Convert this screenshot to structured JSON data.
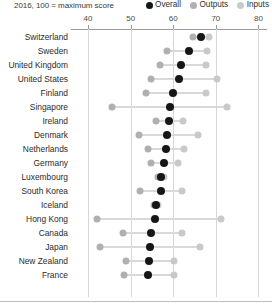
{
  "header": {
    "subtitle": "2016, 100 = maximum score"
  },
  "legend": {
    "position": "top-right",
    "entries": [
      {
        "label": "Overall",
        "color": "#161616",
        "key": "overall"
      },
      {
        "label": "Outputs",
        "color": "#b0b0b0",
        "key": "outputs"
      },
      {
        "label": "Inputs",
        "color": "#c9c9c9",
        "key": "inputs"
      }
    ]
  },
  "axis": {
    "ticks": [
      40,
      50,
      60,
      70,
      80
    ],
    "tick_labels": [
      "40",
      "50",
      "60",
      "70",
      "80"
    ],
    "min": 36,
    "max": 82,
    "position": "top"
  },
  "chart_data": {
    "type": "scatter",
    "subtype": "dot-plot",
    "title": "",
    "subtitle": "2016, 100 = maximum score",
    "xlabel": "",
    "ylabel": "",
    "xlim": [
      36,
      82
    ],
    "grid": true,
    "legend_position": "top-right",
    "categories": [
      "Switzerland",
      "Sweden",
      "United Kingdom",
      "United States",
      "Finland",
      "Singapore",
      "Ireland",
      "Denmark",
      "Netherlands",
      "Germany",
      "Luxembourg",
      "South Korea",
      "Iceland",
      "Hong Kong",
      "Canada",
      "Japan",
      "New Zealand",
      "France"
    ],
    "series": [
      {
        "name": "Overall",
        "color": "#161616",
        "values": [
          66.5,
          63.6,
          61.9,
          61.4,
          59.9,
          59.2,
          59.0,
          58.5,
          58.3,
          57.9,
          57.1,
          57.1,
          55.9,
          55.7,
          54.7,
          54.5,
          54.2,
          54.0
        ]
      },
      {
        "name": "Outputs",
        "color": "#b0b0b0",
        "values": [
          64.6,
          58.5,
          56.8,
          54.8,
          53.7,
          45.6,
          55.9,
          52.0,
          54.0,
          54.7,
          56.5,
          52.2,
          55.4,
          42.0,
          48.1,
          42.8,
          48.9,
          48.5
        ]
      },
      {
        "name": "Inputs",
        "color": "#c9c9c9",
        "values": [
          68.5,
          67.9,
          67.7,
          70.2,
          67.8,
          72.7,
          62.2,
          65.8,
          62.6,
          61.1,
          57.8,
          62.1,
          56.4,
          71.1,
          62.1,
          66.2,
          60.2,
          60.1
        ]
      }
    ]
  }
}
